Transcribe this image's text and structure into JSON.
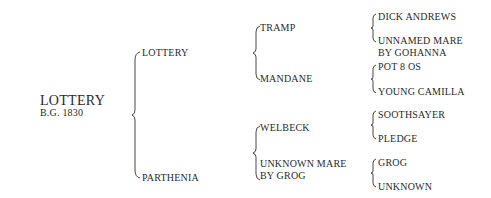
{
  "subject": {
    "name": "LOTTERY",
    "info": "B.G. 1830"
  },
  "generation1": {
    "sire": "LOTTERY",
    "dam": "PARTHENIA"
  },
  "generation2": {
    "sire_sire": "TRAMP",
    "sire_dam": "MANDANE",
    "dam_sire": "WELBECK",
    "dam_dam_line1": "UNKNOWN MARE",
    "dam_dam_line2": "BY GROG"
  },
  "generation3": {
    "tramp_sire": "DICK ANDREWS",
    "tramp_dam_line1": "UNNAMED MARE",
    "tramp_dam_line2": "BY GOHANNA",
    "mandane_sire": "POT 8 OS",
    "mandane_dam": "YOUNG CAMILLA",
    "welbeck_sire": "SOOTHSAYER",
    "welbeck_dam": "PLEDGE",
    "unknown_mare_sire": "GROG",
    "unknown_mare_dam": "UNKNOWN"
  }
}
